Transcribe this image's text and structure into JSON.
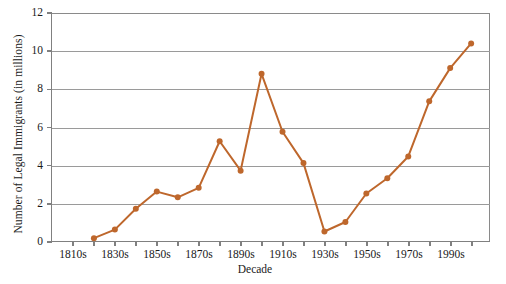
{
  "chart_data": {
    "type": "line",
    "title": "",
    "xlabel": "Decade",
    "ylabel": "Number of Legal Immigrants (in millions)",
    "categories": [
      "1810s",
      "1820s",
      "1830s",
      "1840s",
      "1850s",
      "1860s",
      "1870s",
      "1880s",
      "1890s",
      "1900s",
      "1910s",
      "1920s",
      "1930s",
      "1940s",
      "1950s",
      "1960s",
      "1970s",
      "1980s",
      "1990s",
      "2000s"
    ],
    "x_tick_labels": [
      "1810s",
      "1830s",
      "1850s",
      "1870s",
      "1890s",
      "1910s",
      "1930s",
      "1950s",
      "1970s",
      "1990s"
    ],
    "y_tick_labels": [
      "0",
      "2",
      "4",
      "6",
      "8",
      "10",
      "12"
    ],
    "y_ticks": [
      0,
      2,
      4,
      6,
      8,
      10,
      12
    ],
    "ylim": [
      0,
      12
    ],
    "grid": "horizontal",
    "legend": "none",
    "series": [
      {
        "name": "Legal immigrants",
        "color": "#BE672C",
        "marker": "circle",
        "points": [
          {
            "x": "1820s",
            "y": 0.15
          },
          {
            "x": "1830s",
            "y": 0.6
          },
          {
            "x": "1840s",
            "y": 1.7
          },
          {
            "x": "1850s",
            "y": 2.6
          },
          {
            "x": "1860s",
            "y": 2.3
          },
          {
            "x": "1870s",
            "y": 2.8
          },
          {
            "x": "1880s",
            "y": 5.25
          },
          {
            "x": "1890s",
            "y": 3.7
          },
          {
            "x": "1900s",
            "y": 8.8
          },
          {
            "x": "1910s",
            "y": 5.75
          },
          {
            "x": "1920s",
            "y": 4.1
          },
          {
            "x": "1930s",
            "y": 0.5
          },
          {
            "x": "1940s",
            "y": 1.0
          },
          {
            "x": "1950s",
            "y": 2.5
          },
          {
            "x": "1960s",
            "y": 3.3
          },
          {
            "x": "1970s",
            "y": 4.45
          },
          {
            "x": "1980s",
            "y": 7.35
          },
          {
            "x": "1990s",
            "y": 9.1
          },
          {
            "x": "2000s",
            "y": 10.4
          }
        ]
      }
    ]
  },
  "axis_colors": {
    "axis_line": "#808080",
    "gridline": "#9a9a9a",
    "text": "#1a1a1a"
  }
}
